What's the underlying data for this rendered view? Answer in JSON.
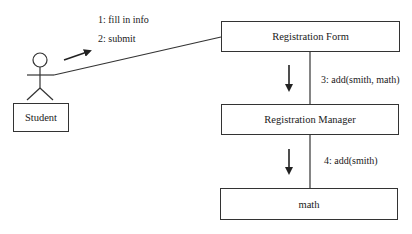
{
  "diagram": {
    "type": "UML collaboration diagram",
    "actor": {
      "label": "Student"
    },
    "objects": [
      {
        "id": "form",
        "label": "Registration Form"
      },
      {
        "id": "manager",
        "label": "Registration Manager"
      },
      {
        "id": "course",
        "label": "math"
      }
    ],
    "messages": [
      {
        "label": "1: fill in info",
        "from": "Student",
        "to": "Registration Form"
      },
      {
        "label": "2: submit",
        "from": "Student",
        "to": "Registration Form"
      },
      {
        "label": "3: add(smith, math)",
        "from": "Registration Form",
        "to": "Registration Manager"
      },
      {
        "label": "4: add(smith)",
        "from": "Registration Manager",
        "to": "math"
      }
    ],
    "colors": {
      "line": "#333333",
      "text": "#1a1a1a",
      "background": "#ffffff"
    }
  }
}
